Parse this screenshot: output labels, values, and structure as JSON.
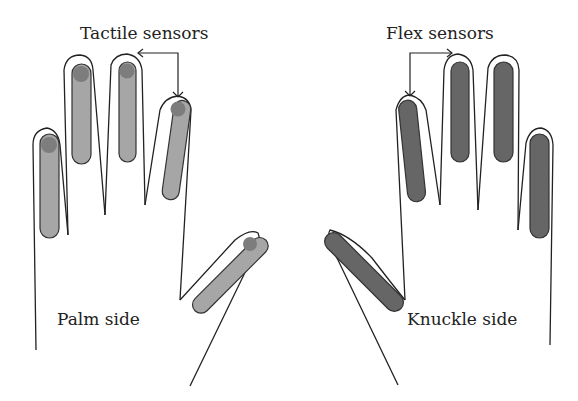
{
  "labels": {
    "tactile": "Tactile sensors",
    "flex": "Flex sensors",
    "palm": "Palm side",
    "knuckle": "Knuckle side"
  },
  "colors": {
    "tactile_sensor": "#a6a6a6",
    "tactile_tip": "#7d7d7d",
    "flex_sensor": "#666666",
    "outline": "#222222"
  }
}
